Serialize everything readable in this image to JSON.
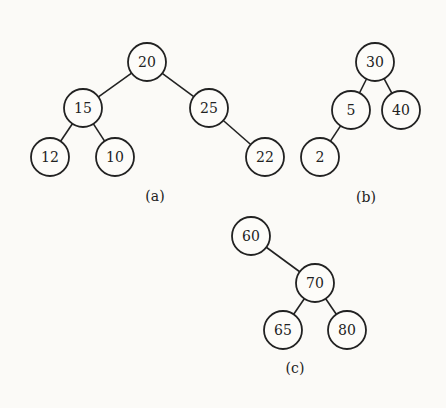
{
  "diagrams": [
    {
      "caption": "(a)",
      "caption_pos": [
        155,
        196
      ],
      "nodes": [
        {
          "id": "20",
          "label": "20",
          "x": 147,
          "y": 62
        },
        {
          "id": "15",
          "label": "15",
          "x": 83,
          "y": 108
        },
        {
          "id": "25",
          "label": "25",
          "x": 209,
          "y": 108
        },
        {
          "id": "12",
          "label": "12",
          "x": 50,
          "y": 157
        },
        {
          "id": "10",
          "label": "10",
          "x": 115,
          "y": 157
        },
        {
          "id": "22",
          "label": "22",
          "x": 265,
          "y": 157
        }
      ],
      "edges": [
        [
          "20",
          "15"
        ],
        [
          "20",
          "25"
        ],
        [
          "15",
          "12"
        ],
        [
          "15",
          "10"
        ],
        [
          "25",
          "22"
        ]
      ]
    },
    {
      "caption": "(b)",
      "caption_pos": [
        366,
        197
      ],
      "nodes": [
        {
          "id": "30",
          "label": "30",
          "x": 375,
          "y": 62
        },
        {
          "id": "5",
          "label": "5",
          "x": 351,
          "y": 110
        },
        {
          "id": "40",
          "label": "40",
          "x": 401,
          "y": 110
        },
        {
          "id": "2",
          "label": "2",
          "x": 320,
          "y": 157
        }
      ],
      "edges": [
        [
          "30",
          "5"
        ],
        [
          "30",
          "40"
        ],
        [
          "5",
          "2"
        ]
      ]
    },
    {
      "caption": "(c)",
      "caption_pos": [
        295,
        368
      ],
      "nodes": [
        {
          "id": "60",
          "label": "60",
          "x": 251,
          "y": 236
        },
        {
          "id": "70",
          "label": "70",
          "x": 315,
          "y": 283
        },
        {
          "id": "65",
          "label": "65",
          "x": 283,
          "y": 330
        },
        {
          "id": "80",
          "label": "80",
          "x": 347,
          "y": 330
        }
      ],
      "edges": [
        [
          "60",
          "70"
        ],
        [
          "70",
          "65"
        ],
        [
          "70",
          "80"
        ]
      ]
    }
  ],
  "node_radius": 19
}
